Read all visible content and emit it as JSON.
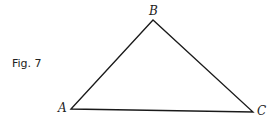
{
  "figure": {
    "caption": "Fig. 7",
    "shape": "triangle",
    "vertices": [
      {
        "label": "A",
        "x": 71,
        "y": 109
      },
      {
        "label": "B",
        "x": 153,
        "y": 20
      },
      {
        "label": "C",
        "x": 253,
        "y": 112
      }
    ],
    "line_color": "#1a1a1a"
  }
}
